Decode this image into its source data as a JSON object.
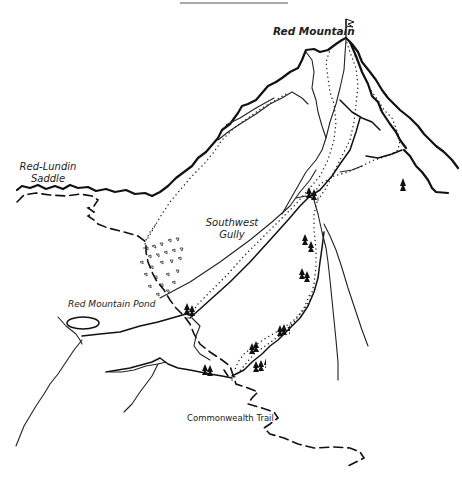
{
  "map": {
    "title_rule": true,
    "labels": {
      "red_mountain": "Red Mountain",
      "red_lundin_saddle_line1": "Red-Lundin",
      "red_lundin_saddle_line2": "Saddle",
      "southwest_gully_line1": "Southwest",
      "southwest_gully_line2": "Gully",
      "red_mountain_pond": "Red Mountain Pond",
      "commonwealth_trail": "Commonwealth Trail"
    },
    "features": {
      "summit_flag": "summit-flag-icon",
      "trees": "tree-icon",
      "boulders": "boulder-field",
      "pond": "pond-outline"
    },
    "legend_styles": {
      "ridge_line": "solid-thick",
      "route": "dotted",
      "trail": "dashed",
      "stream": "solid-thin"
    },
    "colors": {
      "ink": "#111111",
      "background": "#ffffff"
    }
  }
}
